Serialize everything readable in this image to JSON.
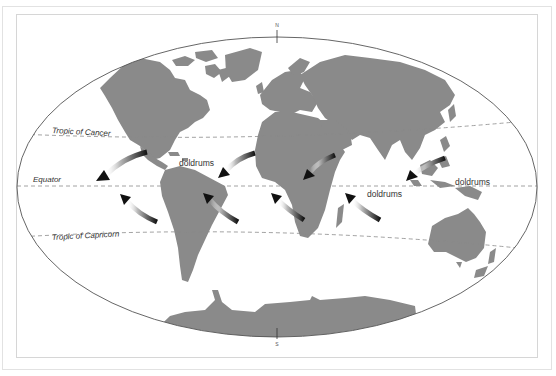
{
  "caption": "",
  "map": {
    "type": "world-map-trade-winds",
    "compass": {
      "north": "N",
      "south": "S"
    },
    "lines": {
      "tropic_of_cancer": "Tropic of Cancer",
      "equator": "Equator",
      "tropic_of_capricorn": "Tropic of Capricorn"
    },
    "labels": {
      "doldrums_americas": "doldrums",
      "doldrums_indian_ocean": "doldrums",
      "doldrums_pacific": "doldrums"
    },
    "colors": {
      "land": "#8a8a8a",
      "ocean": "#ffffff",
      "outline": "#555555",
      "dashed_lines": "#888888",
      "arrow_head": "#111111"
    },
    "arrows": [
      {
        "id": "ne-trade-americas-west",
        "from": [
          145,
          155
        ],
        "to": [
          97,
          178
        ]
      },
      {
        "id": "se-trade-americas-west",
        "from": [
          155,
          225
        ],
        "to": [
          122,
          198
        ]
      },
      {
        "id": "ne-trade-atlantic",
        "from": [
          255,
          155
        ],
        "to": [
          220,
          178
        ]
      },
      {
        "id": "se-trade-atlantic",
        "from": [
          245,
          225
        ],
        "to": [
          205,
          197
        ]
      },
      {
        "id": "ne-trade-africa-east",
        "from": [
          355,
          155
        ],
        "to": [
          305,
          178
        ]
      },
      {
        "id": "se-trade-indian-west",
        "from": [
          305,
          220
        ],
        "to": [
          272,
          196
        ]
      },
      {
        "id": "ne-trade-asia",
        "from": [
          445,
          160
        ],
        "to": [
          408,
          180
        ]
      },
      {
        "id": "se-trade-indian-east",
        "from": [
          385,
          218
        ],
        "to": [
          345,
          197
        ]
      }
    ]
  }
}
